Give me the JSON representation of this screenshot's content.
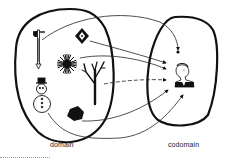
{
  "diagram": {
    "domain": {
      "label": "domain",
      "elements": [
        {
          "name": "sword-icon"
        },
        {
          "name": "diamond-sign-icon"
        },
        {
          "name": "sunburst-icon"
        },
        {
          "name": "tree-icon"
        },
        {
          "name": "snowman-icon"
        },
        {
          "name": "hexagon-icon"
        }
      ]
    },
    "codomain": {
      "label": "codomain",
      "elements": [
        {
          "name": "dot-point"
        },
        {
          "name": "washington-portrait-icon"
        }
      ]
    },
    "mappings": [
      {
        "from": "sword-icon",
        "to": "dot-point"
      },
      {
        "from": "diamond-sign-icon",
        "to": "washington-portrait-icon"
      },
      {
        "from": "sunburst-icon",
        "to": "washington-portrait-icon"
      },
      {
        "from": "tree-icon",
        "to": "washington-portrait-icon"
      },
      {
        "from": "snowman-icon",
        "to": "washington-portrait-icon"
      },
      {
        "from": "hexagon-icon",
        "to": "washington-portrait-icon"
      }
    ]
  }
}
